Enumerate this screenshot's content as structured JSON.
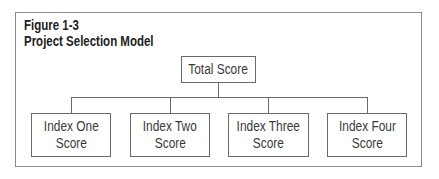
{
  "figure": {
    "number": "Figure 1-3",
    "title": "Project Selection Model"
  },
  "diagram": {
    "root": {
      "label": "Total Score"
    },
    "children": [
      {
        "line1": "Index One",
        "line2": "Score"
      },
      {
        "line1": "Index Two",
        "line2": "Score"
      },
      {
        "line1": "Index Three",
        "line2": "Score"
      },
      {
        "line1": "Index Four",
        "line2": "Score"
      }
    ]
  }
}
